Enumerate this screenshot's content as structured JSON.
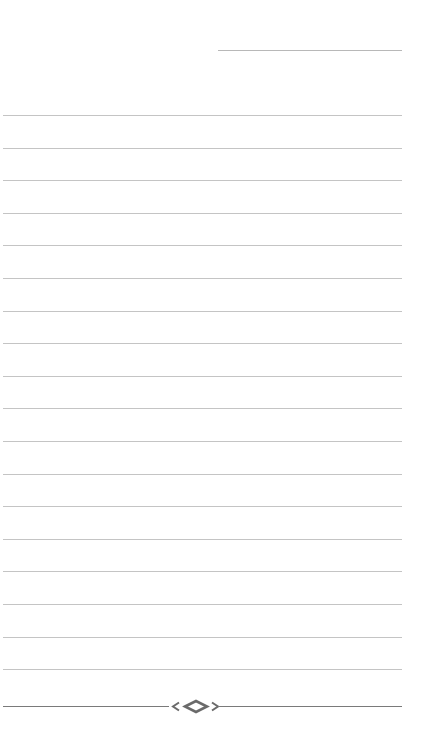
{
  "page": {
    "type": "lined-notebook-page",
    "background": "#ffffff",
    "rule_color": "#c4c4c4",
    "ornament_color": "#7a7a7a"
  },
  "header": {
    "date_line": {
      "visible": true
    }
  },
  "rules": {
    "count": 18,
    "first_y": 115,
    "spacing": 32.6
  },
  "footer": {
    "ornament": "diamond-with-curls"
  }
}
